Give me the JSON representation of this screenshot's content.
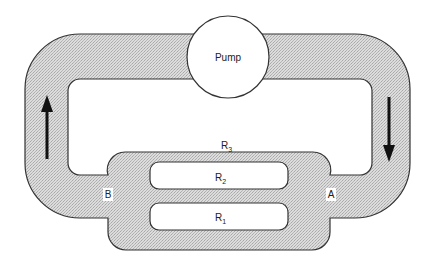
{
  "diagram": {
    "type": "hydraulic circuit analogy",
    "colors": {
      "fluid_fill": "#d4d4d4",
      "outline": "#333333",
      "background": "#ffffff",
      "arrow": "#111111"
    },
    "pump": {
      "label": "Pump"
    },
    "nodes": {
      "a": {
        "label": "A"
      },
      "b": {
        "label": "B"
      }
    },
    "resistors": [
      {
        "id": "r1",
        "letter": "R",
        "subscript": "1"
      },
      {
        "id": "r2",
        "letter": "R",
        "subscript": "2"
      },
      {
        "id": "r3",
        "letter": "R",
        "subscript": "3"
      }
    ],
    "flow_arrows": [
      {
        "side": "left",
        "direction": "up"
      },
      {
        "side": "right",
        "direction": "down"
      }
    ]
  }
}
